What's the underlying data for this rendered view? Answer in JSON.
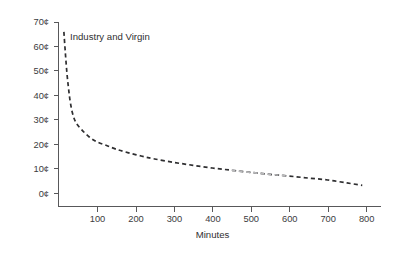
{
  "chart_data": {
    "type": "line",
    "title": "",
    "subtitle": "",
    "xlabel": "Minutes",
    "ylabel": "",
    "xlim": [
      0,
      840
    ],
    "ylim": [
      0,
      70
    ],
    "grid": false,
    "legend_position": "inline-annotation",
    "x_tick_labels": [
      "100",
      "200",
      "300",
      "400",
      "500",
      "600",
      "700",
      "800"
    ],
    "x_tick_values": [
      100,
      200,
      300,
      400,
      500,
      600,
      700,
      800
    ],
    "y_tick_labels": [
      "0¢",
      "10¢",
      "20¢",
      "30¢",
      "40¢",
      "50¢",
      "60¢",
      "70¢"
    ],
    "y_tick_values": [
      0,
      10,
      20,
      30,
      40,
      50,
      60,
      70
    ],
    "series": [
      {
        "name": "Industry and Virgin",
        "style": "dashed",
        "color": "#2e2e30",
        "annotation_label": "Industry and Virgin",
        "x": [
          14,
          18,
          22,
          26,
          30,
          36,
          45,
          60,
          80,
          100,
          125,
          150,
          180,
          215,
          250,
          300,
          350,
          400,
          450,
          500,
          550,
          600,
          650,
          700,
          750,
          790
        ],
        "values": [
          66,
          57,
          49,
          43,
          38,
          33,
          29,
          26,
          23,
          21,
          19.5,
          18,
          16.6,
          15.2,
          14,
          12.6,
          11.4,
          10.3,
          9.4,
          8.5,
          7.7,
          7,
          6.2,
          5.4,
          4.2,
          3.2
        ]
      }
    ],
    "annotations": [
      {
        "text": "Industry and Virgin",
        "x": 31,
        "y": 59
      }
    ]
  },
  "axes": {
    "x_axis_title": "Minutes",
    "y_axis_title": ""
  }
}
